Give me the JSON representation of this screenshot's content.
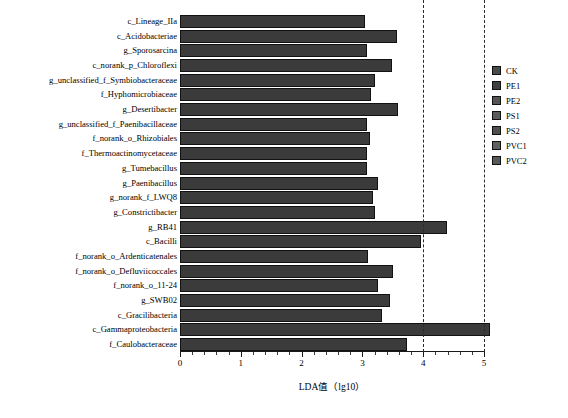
{
  "chart_data": {
    "type": "bar",
    "title": "",
    "subtitle": "",
    "orientation": "horizontal",
    "xlabel": "LDA值（lg10）",
    "ylabel": "",
    "xlim": [
      0,
      5
    ],
    "grid": false,
    "legend_position": "right",
    "annotations": [
      {
        "type": "vline",
        "value": 4,
        "style": "dashed"
      },
      {
        "type": "vline",
        "value": 5,
        "style": "dashed"
      }
    ],
    "x_ticks": [
      0,
      1,
      2,
      3,
      4,
      5
    ],
    "x_tick_labels": [
      "0",
      "1",
      "2",
      "3",
      "4",
      "5"
    ],
    "bar_color": "#3b3b3b",
    "bar_edge_color": "#121212",
    "categories": [
      "c_Lineage_IIa",
      "c_Acidobacteriae",
      "g_Sporosarcina",
      "c_norank_p_Chloroflexi",
      "g_unclassified_f_Symbiobacteraceae",
      "f_Hyphomicrobiaceae",
      "g_Desertibacter",
      "g_unclassified_f_Paenibacillaceae",
      "f_norank_o_Rhizobiales",
      "f_Thermoactinomycetaceae",
      "g_Tumebacillus",
      "g_Paenibacillus",
      "g_norank_f_LWQ8",
      "g_Constrictibacter",
      "g_RB41",
      "c_Bacilli",
      "f_norank_o_Ardenticatenales",
      "f_norank_o_Defluviicoccales",
      "f_norank_o_11-24",
      "g_SWB02",
      "c_Gracilibacteria",
      "c_Gammaproteobacteria",
      "f_Caulobacteraceae"
    ],
    "values": [
      3.05,
      3.57,
      3.08,
      3.49,
      3.21,
      3.14,
      3.59,
      3.08,
      3.12,
      3.07,
      3.07,
      3.25,
      3.18,
      3.21,
      4.39,
      3.97,
      3.1,
      3.5,
      3.25,
      3.45,
      3.32,
      5.1,
      3.73
    ],
    "legend": [
      {
        "label": "CK",
        "color": "#4a4a4a"
      },
      {
        "label": "PE1",
        "color": "#3f3f3f"
      },
      {
        "label": "PE2",
        "color": "#555555"
      },
      {
        "label": "PS1",
        "color": "#5c5c5c"
      },
      {
        "label": "PS2",
        "color": "#4f4f4f"
      },
      {
        "label": "PVC1",
        "color": "#606060"
      },
      {
        "label": "PVC2",
        "color": "#585858"
      }
    ]
  }
}
